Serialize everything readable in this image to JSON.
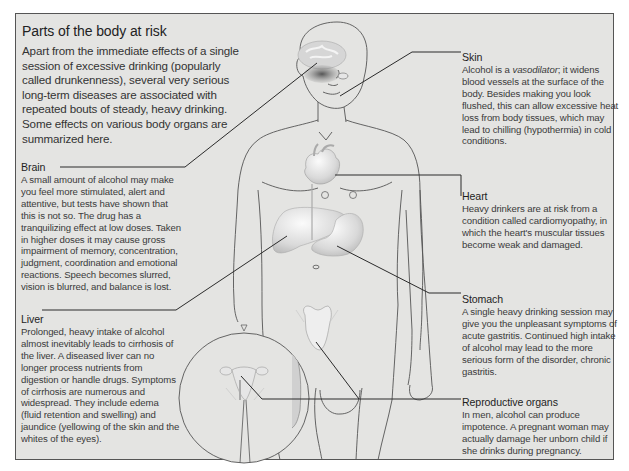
{
  "title": "Parts of the body at risk",
  "intro": "Apart from the immediate effects of a single session of excessive drinking (popularly called drunkenness), several very serious long-term diseases are associated with repeated bouts of steady, heavy drinking. Some effects on various body organs are summarized here.",
  "callouts": {
    "skin": {
      "heading": "Skin",
      "text_pre": "Alcohol is a ",
      "text_em": "vasodilator",
      "text_post": "; it widens blood vessels at the surface of the body. Besides making you look flushed, this can allow excessive heat loss from body tissues, which may lead to chilling (hypothermia) in cold conditions."
    },
    "brain": {
      "heading": "Brain",
      "text": "A small amount of alcohol may make you feel more stimulated, alert and attentive, but tests have shown that this is not so. The drug has a tranquilizing effect at low doses. Taken in higher doses it may cause gross impairment of memory, concentration, judgment, coordination and emotional reactions. Speech becomes slurred, vision is blurred, and balance is lost."
    },
    "liver": {
      "heading": "Liver",
      "text": "Prolonged, heavy intake of alcohol almost inevitably leads to cirrhosis of the liver. A diseased liver can no longer process nutrients from digestion or handle drugs. Symptoms of cirrhosis are numerous and widespread. They include edema (fluid retention and swelling) and jaundice (yellowing of the skin and the whites of the eyes)."
    },
    "heart": {
      "heading": "Heart",
      "text": "Heavy drinkers are at risk from a condition called cardiomyopathy, in which the heart's muscular tissues become weak and damaged."
    },
    "stomach": {
      "heading": "Stomach",
      "text": "A single heavy drinking session may give you the unpleasant symptoms of acute gastritis. Continued high intake of alcohol may lead to the more serious form of the disorder, chronic gastritis."
    },
    "reproductive": {
      "heading": "Reproductive organs",
      "text": "In men, alcohol can produce impotence. A pregnant woman may actually damage her unborn child if she drinks during pregnancy."
    }
  },
  "colors": {
    "panel_background": "#e4e4e2",
    "border": "#555555",
    "outline": "#555555",
    "leader_line": "#2a2a2a",
    "organ_fill": "#f2f2f2",
    "brain_shade": "#8a8a8a"
  }
}
